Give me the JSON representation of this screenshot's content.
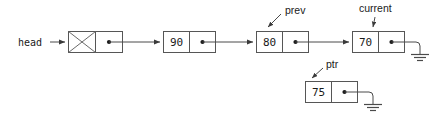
{
  "diagram": {
    "colors": {
      "box_stroke": "#565656",
      "line": "#4a4a4a",
      "text": "#1a1a1a",
      "background": "#ffffff"
    },
    "labels": {
      "head": "head",
      "prev": "prev",
      "current": "current",
      "ptr": "ptr"
    },
    "nodes": [
      {
        "id": "header",
        "value": "",
        "crossed": true,
        "row": "main",
        "x": 68,
        "y": 31,
        "next": "n90"
      },
      {
        "id": "n90",
        "value": "90",
        "crossed": false,
        "row": "main",
        "x": 163,
        "y": 31,
        "next": "n80"
      },
      {
        "id": "n80",
        "value": "80",
        "crossed": false,
        "row": "main",
        "x": 256,
        "y": 31,
        "next": "n70"
      },
      {
        "id": "n70",
        "value": "70",
        "crossed": false,
        "row": "main",
        "x": 352,
        "y": 31,
        "next": "null"
      },
      {
        "id": "n75",
        "value": "75",
        "crossed": false,
        "row": "lower",
        "x": 305,
        "y": 81,
        "next": "null"
      }
    ],
    "pointer_variables": [
      {
        "name": "head",
        "points_to": "header",
        "style": "horizontal-arrow"
      },
      {
        "name": "prev",
        "points_to": "n80",
        "style": "diagonal-arrow"
      },
      {
        "name": "current",
        "points_to": "n70",
        "style": "down-arrow"
      },
      {
        "name": "ptr",
        "points_to": "n75",
        "style": "diagonal-arrow"
      }
    ],
    "null_terminators": [
      {
        "from_node": "n70",
        "symbol": "ground"
      },
      {
        "from_node": "n75",
        "symbol": "ground"
      }
    ],
    "legend": {
      "crossed_box_meaning": "header / dummy node (no data)",
      "ground_symbol_meaning": "NULL pointer"
    }
  }
}
